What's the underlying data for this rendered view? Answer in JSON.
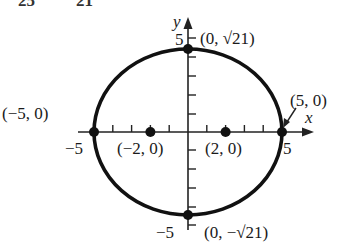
{
  "figure": {
    "cut_text_left": "25",
    "cut_text_right": "21",
    "axis_x_label": "x",
    "axis_y_label": "y",
    "tick_labels": {
      "y_top": "5",
      "y_bottom": "−5",
      "x_left": "−5",
      "x_right": "5"
    },
    "points": [
      {
        "name": "vertex-top",
        "label": "(0, √21)",
        "x": 0,
        "y": 4.583
      },
      {
        "name": "vertex-bottom",
        "label": "(0, −√21)",
        "x": 0,
        "y": -4.583
      },
      {
        "name": "vertex-left",
        "label": "(−5, 0)",
        "x": -5,
        "y": 0
      },
      {
        "name": "vertex-right",
        "label": "(5, 0)",
        "x": 5,
        "y": 0
      },
      {
        "name": "focus-left",
        "label": "(−2, 0)",
        "x": -2,
        "y": 0
      },
      {
        "name": "focus-right",
        "label": "(2, 0)",
        "x": 2,
        "y": 0
      }
    ],
    "ellipse": {
      "equation": "x^2/25 + y^2/21 = 1",
      "a": 5,
      "b": 4.583,
      "c": 2
    },
    "colors": {
      "curve": "#111111",
      "axis": "#222222",
      "text": "#1a1a1a"
    }
  }
}
